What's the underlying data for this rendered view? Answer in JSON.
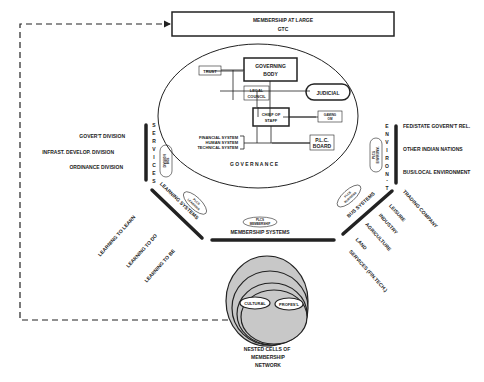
{
  "title_box": {
    "line1": "MEMBERSHIP AT LARGE",
    "line2": "GTC"
  },
  "governance": {
    "label": "G O V E R N A N C E",
    "governing_body": {
      "line1": "GOVERNING",
      "line2": "BODY"
    },
    "trust": "TRUST",
    "legal_council": {
      "line1": "LEGAL",
      "line2": "COUNCIL"
    },
    "judicial": "JUDICIAL",
    "chief_of_staff": {
      "line1": "CHIEF OF",
      "line2": "STAFF"
    },
    "gaming": {
      "line1": "GAMING",
      "line2": "OM"
    },
    "systems": [
      "FINANCIAL SYSTEM",
      "HUMAN SYSTEM",
      "TECHNICAL SYSTEM"
    ],
    "plc_board": {
      "line1": "P.L.C.",
      "line2": "BOARD"
    }
  },
  "services": {
    "vertical_label": [
      "S",
      "E",
      "R",
      "V",
      "I",
      "C",
      "E",
      "S"
    ],
    "items": [
      "GOVER'T DIVISION",
      "INFRAST. DEVELOP. DIVISION",
      "ORDINANCE DIVISION"
    ],
    "ellipse": {
      "line1": "DIVISION",
      "line2": "BOS"
    }
  },
  "environment": {
    "vertical_label": [
      "E",
      "N",
      "V",
      "I",
      "R",
      "O",
      "N",
      "-",
      "T"
    ],
    "items": [
      "FED/STATE GOVERN'T REL.",
      "OTHER INDIAN NATIONS",
      "BUS/LOCAL ENVIRONMENT"
    ],
    "ellipse": {
      "line1": "PLCS",
      "line2": "ENVIRONM."
    }
  },
  "learning": {
    "label": "LEARNING SYSTEMS",
    "items": [
      "LEARNING TO LEARN",
      "LEARNING TO DO",
      "LEARNING TO BE"
    ],
    "ellipse": {
      "line1": "PLCS",
      "line2": "LEARNING"
    }
  },
  "membership": {
    "label": "MEMBERSHIP SYSTEMS",
    "ellipse": {
      "line1": "PLCS",
      "line2": "MEMBERSHIP"
    }
  },
  "business": {
    "label": "BUS SYSTEMS",
    "items": [
      "TRADING COMPANY",
      "LEISURE",
      "INDUSTRY",
      "AGRICULTURE",
      "LAND",
      "SERVICES (FIN.TECH.)"
    ],
    "ellipse": {
      "line1": "PLCS",
      "line2": "BUSINESS"
    }
  },
  "nested_cells": {
    "cultural": "CULTURAL",
    "professional": "PROFES'L",
    "caption": [
      "NESTED CELLS OF",
      "MEMBERSHIP",
      "NETWORK"
    ]
  },
  "colors": {
    "ink": "#222222",
    "cell_fill": "#c8c8c8",
    "background": "#ffffff"
  }
}
